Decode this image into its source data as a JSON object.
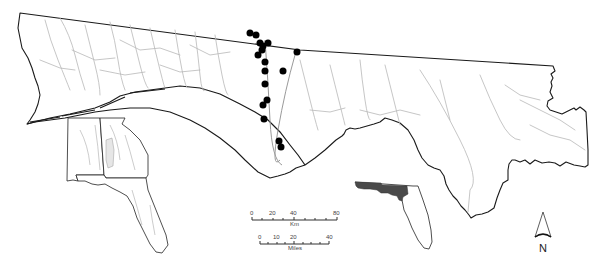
{
  "figure": {
    "type": "study-area-map",
    "region": "Florida panhandle and northwest Florida river basins"
  },
  "scale_bar_km": {
    "ticks": [
      "0",
      "20",
      "40",
      "80"
    ],
    "unit": "Km"
  },
  "scale_bar_miles": {
    "ticks": [
      "0",
      "10",
      "20",
      "40"
    ],
    "unit": "Miles"
  },
  "north_arrow": {
    "label": "N"
  },
  "sites": {
    "count": 17,
    "marker": "filled-black-circle",
    "points": [
      [
        250,
        33
      ],
      [
        256,
        35
      ],
      [
        260,
        43
      ],
      [
        263,
        45
      ],
      [
        267,
        43
      ],
      [
        262,
        50
      ],
      [
        259,
        55
      ],
      [
        297,
        52
      ],
      [
        265,
        62
      ],
      [
        265,
        71
      ],
      [
        283,
        71
      ],
      [
        265,
        84
      ],
      [
        266,
        101
      ],
      [
        263,
        104
      ],
      [
        264,
        120
      ],
      [
        278,
        143
      ],
      [
        281,
        148
      ]
    ]
  },
  "colors": {
    "boundary": "#1a1a1a",
    "rivers": "#b8b8b8",
    "sites": "#000000",
    "study_area_inset": "#4a4a4a",
    "highlight_basin": "#e6e6e6"
  },
  "insets": {
    "southeast_us": "Alabama, Georgia and Florida with rivers and highlighted basin",
    "florida": "Florida outline with panhandle study area shaded dark"
  }
}
